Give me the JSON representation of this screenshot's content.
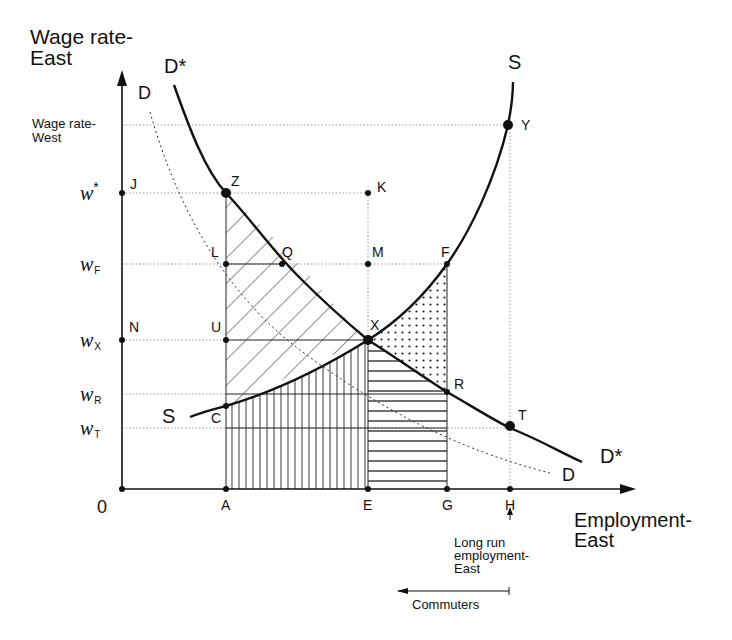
{
  "diagram": {
    "y_axis_title": [
      "Wage rate-",
      "East"
    ],
    "x_axis_title": [
      "Employment-",
      "East"
    ],
    "origin_label": "0",
    "y_tick_labels": {
      "wage_west": [
        "Wage rate-",
        "West"
      ],
      "w_star": {
        "base": "w",
        "sup": "*"
      },
      "w_F": {
        "base": "w",
        "sub": "F"
      },
      "w_X": {
        "base": "w",
        "sub": "X"
      },
      "w_R": {
        "base": "w",
        "sub": "R"
      },
      "w_T": {
        "base": "w",
        "sub": "T"
      }
    },
    "x_tick_labels": [
      "A",
      "E",
      "G",
      "H"
    ],
    "curve_labels": {
      "d_star_top": "D*",
      "d_star_bottom": "D*",
      "d_top": "D",
      "d_bottom": "D",
      "s_top": "S",
      "s_left": "S"
    },
    "point_labels": [
      "J",
      "Z",
      "K",
      "L",
      "Q",
      "M",
      "F",
      "N",
      "U",
      "X",
      "R",
      "C",
      "T",
      "Y"
    ],
    "annotations": {
      "long_run": [
        "Long run",
        "employment-",
        "East"
      ],
      "commuters": "Commuters"
    },
    "colors": {
      "ink": "#111111",
      "guide": "#9a9a9a",
      "background": "#ffffff"
    }
  }
}
